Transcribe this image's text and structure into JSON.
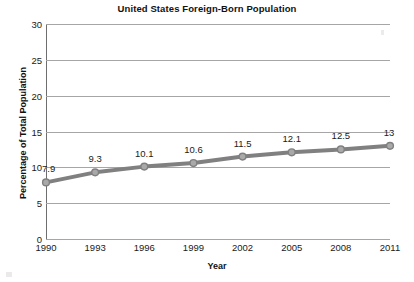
{
  "chart_data": {
    "type": "line",
    "title": "United States Foreign-Born Population",
    "xlabel": "Year",
    "ylabel": "Percentage of Total Population",
    "categories": [
      "1990",
      "1993",
      "1996",
      "1999",
      "2002",
      "2005",
      "2008",
      "2011"
    ],
    "values": [
      7.9,
      9.3,
      10.1,
      10.6,
      11.5,
      12.1,
      12.5,
      13
    ],
    "point_labels": [
      "7.9",
      "9.3",
      "10.1",
      "10.6",
      "11.5",
      "12.1",
      "12.5",
      "13"
    ],
    "ylim": [
      0,
      30
    ],
    "yticks": [
      0,
      5,
      10,
      15,
      20,
      25,
      30
    ],
    "ytick_labels": [
      "0",
      "5",
      "10",
      "15",
      "20",
      "25",
      "30"
    ],
    "grid": true,
    "legend": "none",
    "series_color": "#808080",
    "marker_color": "#a9a9a9",
    "gridline_color": "#a6a6a6"
  }
}
